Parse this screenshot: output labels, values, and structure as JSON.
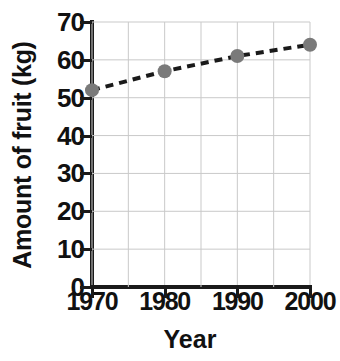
{
  "chart_data": {
    "type": "line",
    "title": "",
    "xlabel": "Year",
    "ylabel": "Amount of fruit (kg)",
    "x": [
      1970,
      1980,
      1990,
      2000
    ],
    "values": [
      52,
      57,
      61,
      64
    ],
    "series": [
      {
        "name": "Amount of fruit",
        "values": [
          52,
          57,
          61,
          64
        ],
        "line_style": "dashed",
        "line_color": "#1a1a1a",
        "marker": "circle",
        "marker_color": "#7a7a7a"
      }
    ],
    "xlim": [
      1970,
      2000
    ],
    "ylim": [
      0,
      70
    ],
    "x_tick_labels": [
      "1970",
      "1980",
      "1990",
      "2000"
    ],
    "y_tick_labels": [
      "0",
      "10",
      "20",
      "30",
      "40",
      "50",
      "60",
      "70"
    ],
    "y_ticks": [
      0,
      10,
      20,
      30,
      40,
      50,
      60,
      70
    ],
    "x_ticks": [
      1970,
      1980,
      1990,
      2000
    ],
    "x_gridlines": [
      1970,
      1975,
      1980,
      1985,
      1990,
      1995,
      2000
    ],
    "y_gridlines": [
      10,
      20,
      30,
      40,
      50,
      60,
      70
    ],
    "grid": true,
    "grid_color": "#c9c9c9",
    "legend": null,
    "legend_position": "none",
    "background_color": "#ffffff"
  }
}
